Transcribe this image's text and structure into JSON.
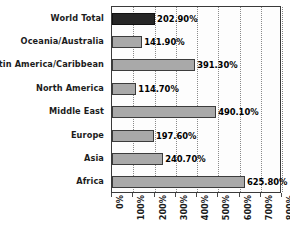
{
  "chart_data": {
    "type": "bar",
    "orientation": "horizontal",
    "title": "",
    "subtitle": "",
    "xlabel": "",
    "ylabel": "",
    "xlim": [
      0,
      800
    ],
    "ylim": null,
    "grid": true,
    "grid_axis": "x",
    "grid_style": "dotted",
    "legend": false,
    "legend_position": "none",
    "value_label_format": "0.00%",
    "categories": [
      "World Total",
      "Oceania/Australia",
      "Latin America/Caribbean",
      "North America",
      "Middle East",
      "Europe",
      "Asia",
      "Africa"
    ],
    "values": [
      202.9,
      141.9,
      391.3,
      114.7,
      490.1,
      197.6,
      240.7,
      625.8
    ],
    "value_labels": [
      "202.90%",
      "141.90%",
      "391.30%",
      "114.70%",
      "490.10%",
      "197.60%",
      "240.70%",
      "625.80%"
    ],
    "bar_colors": [
      "#262626",
      "#a9a9a9",
      "#a9a9a9",
      "#a9a9a9",
      "#a9a9a9",
      "#a9a9a9",
      "#a9a9a9",
      "#a9a9a9"
    ],
    "highlight_category": "World Total",
    "xticks": [
      0,
      100,
      200,
      300,
      400,
      500,
      600,
      700,
      800
    ],
    "xticklabels": [
      "0%",
      "100%",
      "200%",
      "300%",
      "400%",
      "500%",
      "600%",
      "700%",
      "800%"
    ],
    "xticklabel_rotation": 90,
    "plot_background": "#fdfdfd",
    "plot_border_color": "#3a3a3a",
    "bar_border_color": "#3c3c3c",
    "gridline_color": "#8a8a8a",
    "text_color": "#1c1c1c"
  }
}
